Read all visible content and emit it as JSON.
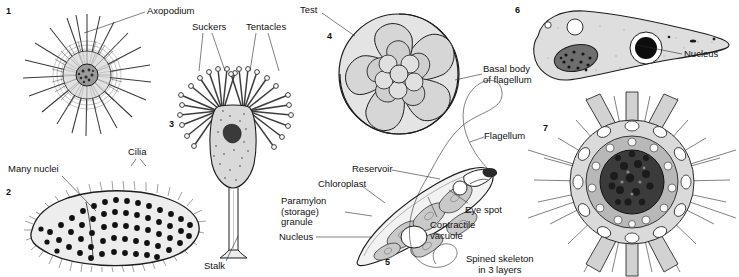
{
  "plate": {
    "title": "Protist diversity plate",
    "background": "#ffffff",
    "ink": "#1c1c1c"
  },
  "figures": [
    {
      "number": "1",
      "name": "heliozoan",
      "number_pos": {
        "x": 6,
        "y": 7
      },
      "labels": [
        {
          "id": "axopodium",
          "text": "Axopodium",
          "x": 147,
          "y": 6,
          "align": "left"
        }
      ]
    },
    {
      "number": "2",
      "name": "multinucleate-ciliate",
      "number_pos": {
        "x": 6,
        "y": 188
      },
      "labels": [
        {
          "id": "many-nuclei",
          "text": "Many nuclei",
          "x": 18,
          "y": 166,
          "align": "left"
        },
        {
          "id": "cilia",
          "text": "Cilia",
          "x": 129,
          "y": 148,
          "align": "left"
        }
      ]
    },
    {
      "number": "3",
      "name": "suctorian",
      "number_pos": {
        "x": 169,
        "y": 120
      },
      "labels": [
        {
          "id": "suckers",
          "text": "Suckers",
          "x": 194,
          "y": 23,
          "align": "left"
        },
        {
          "id": "tentacles",
          "text": "Tentacles",
          "x": 248,
          "y": 23,
          "align": "left"
        },
        {
          "id": "stalk",
          "text": "Stalk",
          "x": 206,
          "y": 262,
          "align": "left"
        }
      ]
    },
    {
      "number": "4",
      "name": "foraminiferan",
      "number_pos": {
        "x": 327,
        "y": 32
      },
      "labels": [
        {
          "id": "test",
          "text": "Test",
          "x": 301,
          "y": 6,
          "align": "left"
        }
      ]
    },
    {
      "number": "5",
      "name": "euglena",
      "number_pos": {
        "x": 385,
        "y": 258
      },
      "labels": [
        {
          "id": "reservoir",
          "text": "Reservoir",
          "x": 354,
          "y": 166,
          "align": "left"
        },
        {
          "id": "chloroplast",
          "text": "Chloroplast",
          "x": 320,
          "y": 180,
          "align": "left"
        },
        {
          "id": "paramylon-granule",
          "text": "Paramylon\n(storage)\ngranule",
          "x": 282,
          "y": 199,
          "align": "left"
        },
        {
          "id": "nucleus-euglena",
          "text": "Nucleus",
          "x": 280,
          "y": 233,
          "align": "left"
        },
        {
          "id": "contractile-vacuole",
          "text": "Contractile\nvacuole",
          "x": 432,
          "y": 221,
          "align": "left"
        },
        {
          "id": "eye-spot",
          "text": "Eye spot",
          "x": 466,
          "y": 206,
          "align": "left"
        },
        {
          "id": "flagellum",
          "text": "Flagellum",
          "x": 485,
          "y": 132,
          "align": "left"
        },
        {
          "id": "basal-body-of-flagellum",
          "text": "Basal body\nof flagellum",
          "x": 484,
          "y": 65,
          "align": "left"
        }
      ]
    },
    {
      "number": "6",
      "name": "flagellate-cell",
      "number_pos": {
        "x": 515,
        "y": 6
      },
      "labels": [
        {
          "id": "nucleus-fig6",
          "text": "Nucleus",
          "x": 684,
          "y": 50,
          "align": "left"
        }
      ]
    },
    {
      "number": "7",
      "name": "radiolarian",
      "number_pos": {
        "x": 543,
        "y": 124
      },
      "labels": [
        {
          "id": "spined-skeleton",
          "text": "Spined skeleton\nin 3 layers",
          "x": 468,
          "y": 255,
          "align": "left"
        }
      ]
    }
  ],
  "leaders": [
    {
      "id": "leader-axopodium",
      "points": "145,12 102,27 84,33"
    },
    {
      "id": "leader-many-nuclei",
      "points": "62,176 90,205 96,211"
    },
    {
      "id": "leader-cilia-left",
      "points": "136,159 131,166"
    },
    {
      "id": "leader-cilia-right",
      "points": "140,159 146,166"
    },
    {
      "id": "leader-suckers-left",
      "points": "203,33 199,71"
    },
    {
      "id": "leader-suckers-right",
      "points": "212,33 225,71"
    },
    {
      "id": "leader-tentacles-left",
      "points": "256,33 250,71"
    },
    {
      "id": "leader-tentacles-right",
      "points": "268,33 279,71"
    },
    {
      "id": "leader-stalk",
      "points": "226,261 238,236"
    },
    {
      "id": "leader-test",
      "points": "322,13 355,36"
    },
    {
      "id": "leader-reservoir",
      "points": "392,170 440,179"
    },
    {
      "id": "leader-chloroplast",
      "points": "362,186 385,203"
    },
    {
      "id": "leader-paramylon",
      "points": "345,212 372,216"
    },
    {
      "id": "leader-nucleus-euglena",
      "points": "316,237 372,237"
    },
    {
      "id": "leader-contractile",
      "points": "437,217 428,197"
    },
    {
      "id": "leader-eye-spot",
      "points": "468,203 449,190"
    },
    {
      "id": "leader-flagellum",
      "points": "484,137 470,142"
    },
    {
      "id": "leader-basal-body",
      "points": "482,74 455,80"
    },
    {
      "id": "leader-nucleus-fig6",
      "points": "682,54 637,45"
    }
  ]
}
